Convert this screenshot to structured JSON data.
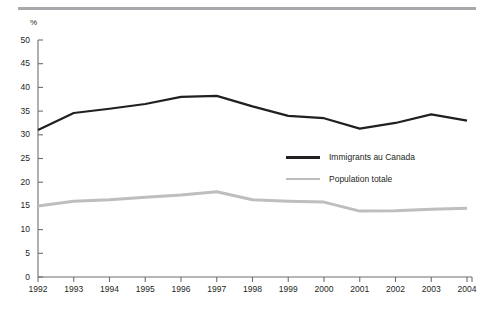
{
  "figure": {
    "unit_label": "%",
    "rule_color": "#a7a9ac"
  },
  "chart_data": {
    "type": "line",
    "title": "",
    "subtitle": "",
    "xlabel": "",
    "ylabel": "%",
    "x": [
      1992,
      1993,
      1994,
      1995,
      1996,
      1997,
      1998,
      1999,
      2000,
      2001,
      2002,
      2003,
      2004
    ],
    "xtick_labels": [
      "1992",
      "1993",
      "1994",
      "1995",
      "1996",
      "1997",
      "1998",
      "1999",
      "2000",
      "2001",
      "2002",
      "2003",
      "2004"
    ],
    "ytick_labels": [
      "0",
      "5",
      "10",
      "15",
      "20",
      "25",
      "30",
      "35",
      "40",
      "45",
      "50"
    ],
    "yticks": [
      0,
      5,
      10,
      15,
      20,
      25,
      30,
      35,
      40,
      45,
      50
    ],
    "ylim": [
      0,
      50
    ],
    "xlim": [
      1992,
      2004
    ],
    "grid": false,
    "legend_position": "center-right",
    "series": [
      {
        "name": "Immigrants au Canada",
        "color": "#231f20",
        "width": 2.2,
        "values": [
          31.0,
          34.6,
          35.5,
          36.5,
          38.0,
          38.2,
          36.0,
          34.0,
          33.5,
          31.3,
          32.5,
          34.3,
          33.0
        ]
      },
      {
        "name": "Population totale",
        "color": "#bcbec0",
        "width": 3.0,
        "values": [
          15.0,
          16.0,
          16.3,
          16.8,
          17.3,
          18.0,
          16.3,
          16.0,
          15.8,
          13.9,
          14.0,
          14.3,
          14.5
        ]
      }
    ]
  }
}
